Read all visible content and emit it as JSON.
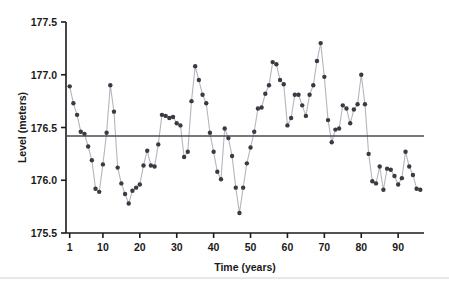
{
  "chart_data": {
    "type": "line",
    "title": "",
    "subtitle": "",
    "xlabel": "Time (years)",
    "ylabel": "Level (meters)",
    "xlim": [
      0,
      97
    ],
    "ylim": [
      175.5,
      177.5
    ],
    "grid": false,
    "legend": null,
    "marker": "filled-circle",
    "marker_color": "#3a3a44",
    "line_color": "#b5b5bd",
    "axis_color": "#1a1a1a",
    "xticks": [
      1,
      10,
      20,
      30,
      40,
      50,
      60,
      70,
      80,
      90
    ],
    "xtick_labels": [
      "1",
      "10",
      "20",
      "30",
      "40",
      "50",
      "60",
      "70",
      "80",
      "90"
    ],
    "yticks": [
      175.5,
      176.0,
      176.5,
      177.0,
      177.5
    ],
    "ytick_labels": [
      "175.5",
      "176.0",
      "176.5",
      "177.0",
      "177.5"
    ],
    "reference_line": {
      "name": "mean-level-line",
      "orientation": "horizontal",
      "y": 176.42,
      "color": "#4a4a52",
      "width": 1.6
    },
    "x": [
      1,
      2,
      3,
      4,
      5,
      6,
      7,
      8,
      9,
      10,
      11,
      12,
      13,
      14,
      15,
      16,
      17,
      18,
      19,
      20,
      21,
      22,
      23,
      24,
      25,
      26,
      27,
      28,
      29,
      30,
      31,
      32,
      33,
      34,
      35,
      36,
      37,
      38,
      39,
      40,
      41,
      42,
      43,
      44,
      45,
      46,
      47,
      48,
      49,
      50,
      51,
      52,
      53,
      54,
      55,
      56,
      57,
      58,
      59,
      60,
      61,
      62,
      63,
      64,
      65,
      66,
      67,
      68,
      69,
      70,
      71,
      72,
      73,
      74,
      75,
      76,
      77,
      78,
      79,
      80,
      81,
      82,
      83,
      84,
      85,
      86,
      87,
      88,
      89,
      90,
      91,
      92,
      93,
      94,
      95,
      96
    ],
    "values": [
      176.89,
      176.73,
      176.62,
      176.46,
      176.44,
      176.32,
      176.19,
      175.92,
      175.89,
      176.15,
      176.45,
      176.9,
      176.65,
      176.12,
      175.97,
      175.87,
      175.78,
      175.9,
      175.93,
      175.96,
      176.14,
      176.28,
      176.14,
      176.13,
      176.34,
      176.62,
      176.61,
      176.59,
      176.6,
      176.54,
      176.52,
      176.22,
      176.27,
      176.75,
      177.08,
      176.95,
      176.81,
      176.73,
      176.45,
      176.27,
      176.08,
      176.01,
      176.49,
      176.4,
      176.23,
      175.93,
      175.69,
      175.93,
      176.16,
      176.31,
      176.46,
      176.68,
      176.69,
      176.82,
      176.9,
      177.12,
      177.1,
      176.95,
      176.91,
      176.52,
      176.59,
      176.81,
      176.81,
      176.71,
      176.61,
      176.81,
      176.9,
      177.13,
      177.3,
      176.98,
      176.57,
      176.36,
      176.48,
      176.49,
      176.71,
      176.68,
      176.54,
      176.67,
      176.72,
      177.0,
      176.72,
      176.25,
      175.99,
      175.97,
      176.13,
      175.91,
      176.11,
      176.1,
      176.04,
      175.96,
      176.02,
      176.27,
      176.13,
      176.05,
      175.92,
      175.91
    ]
  },
  "accessibility": {
    "figure_name": "time-series-level-plot"
  }
}
